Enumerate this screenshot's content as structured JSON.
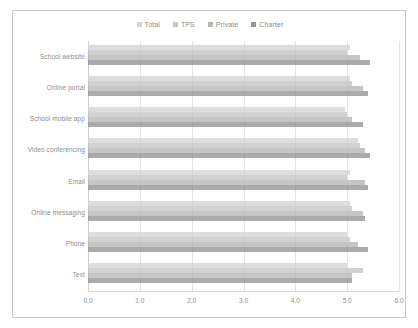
{
  "chart_data": {
    "type": "bar",
    "orientation": "horizontal",
    "title": "",
    "xlabel": "",
    "ylabel": "",
    "xlim": [
      0.0,
      6.0
    ],
    "xticks": [
      "0.0",
      "1.0",
      "2.0",
      "3.0",
      "4.0",
      "5.0",
      "6.0"
    ],
    "xtick_values": [
      0.0,
      1.0,
      2.0,
      3.0,
      4.0,
      5.0,
      6.0
    ],
    "grid": true,
    "legend_position": "top-center",
    "categories": [
      "School website",
      "Online portal",
      "School mobile app",
      "Video conferencing",
      "Email",
      "Online messaging",
      "Phone",
      "Text"
    ],
    "series": [
      {
        "name": "Total",
        "color": "#d4d4d4",
        "values": [
          5.05,
          5.05,
          4.95,
          5.2,
          5.05,
          5.05,
          5.0,
          5.0
        ]
      },
      {
        "name": "TPS",
        "color": "#c4c4c4",
        "values": [
          5.0,
          5.1,
          5.0,
          5.25,
          5.0,
          5.1,
          5.05,
          5.3
        ]
      },
      {
        "name": "Private",
        "color": "#b6b6b6",
        "values": [
          5.25,
          5.3,
          5.1,
          5.35,
          5.35,
          5.3,
          5.2,
          5.1
        ]
      },
      {
        "name": "Charter",
        "color": "#949494",
        "values": [
          5.45,
          5.4,
          5.3,
          5.45,
          5.4,
          5.35,
          5.4,
          5.1
        ]
      }
    ]
  },
  "legend": {
    "items": [
      {
        "label": "Total",
        "color": "#d4d4d4"
      },
      {
        "label": "TPS",
        "color": "#c4c4c4"
      },
      {
        "label": "Private",
        "color": "#b6b6b6"
      },
      {
        "label": "Charter",
        "color": "#949494"
      }
    ]
  },
  "colors": {
    "frame_border": "#c9c9c9",
    "gridline": "#e4e4e4",
    "axis": "#d6d6d6",
    "label_text": "#8d8d8d",
    "background": "#ffffff"
  }
}
